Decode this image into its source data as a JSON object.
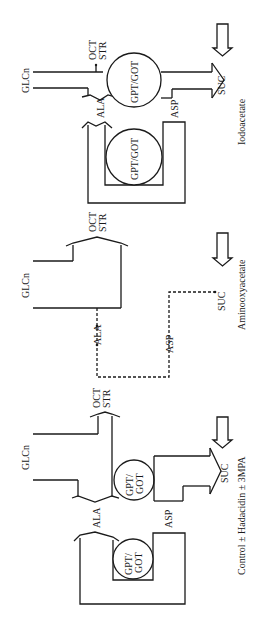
{
  "diagram": {
    "orientation": "rotated 90° clockwise (text reads bottom-to-top)",
    "panels": [
      {
        "id": "iodoacetate",
        "caption": "Iodoacetate",
        "labels": {
          "glc": "GLCn",
          "oct": "OCT",
          "str": "STR",
          "ala": "ALA",
          "asp": "ASP",
          "suc": "SUC",
          "enzyme_main": "GPT/GOT",
          "enzyme_cycle": "GPT/GOT"
        }
      },
      {
        "id": "aminooxyacetate",
        "caption": "Aminooxyacetate",
        "labels": {
          "glc": "GLCn",
          "oct": "OCT",
          "str": "STR",
          "ala": "ALA",
          "asp": "ASP",
          "suc": "SUC"
        }
      },
      {
        "id": "control",
        "caption": "Control ± Hadacidin ± 3MPA",
        "labels": {
          "glc": "GLCn",
          "oct": "OCT",
          "str": "STR",
          "ala": "ALA",
          "asp": "ASP",
          "suc": "SUC",
          "enzyme_main_1": "GPT/",
          "enzyme_main_2": "GOT",
          "enzyme_cycle_1": "GPT/",
          "enzyme_cycle_2": "GOT"
        }
      }
    ]
  }
}
